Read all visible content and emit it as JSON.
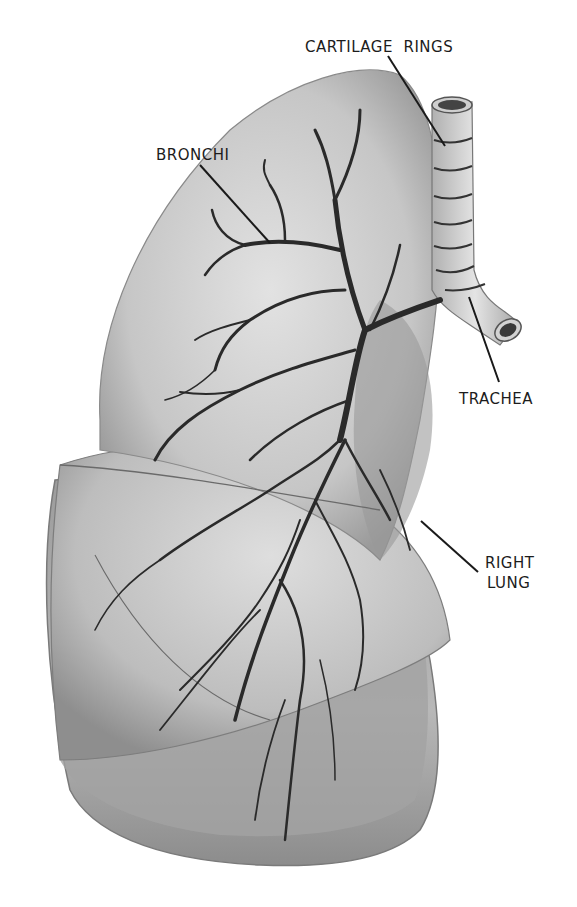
{
  "figure": {
    "style": "grayscale anatomical illustration"
  },
  "labels": {
    "cartilage_rings": "CARTILAGE  RINGS",
    "bronchi": "BRONCHI",
    "trachea": "TRACHEA",
    "right_lung_line1": "RIGHT",
    "right_lung_line2": "LUNG"
  },
  "colors": {
    "background": "#ffffff",
    "lung_light": "#d9d9d9",
    "lung_mid": "#b5b5b5",
    "lung_dark": "#8a8a8a",
    "bronchi": "#2a2a2a",
    "trachea": "#cfcfcf",
    "leader_line": "#1a1a1a",
    "text": "#1c1c1c"
  }
}
